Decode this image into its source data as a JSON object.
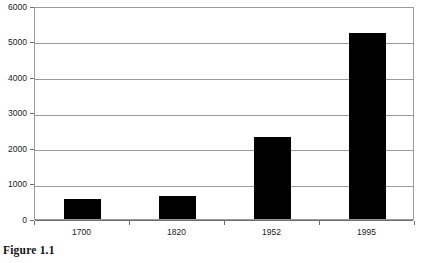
{
  "figure": {
    "caption": "Figure 1.1"
  },
  "chart_data": {
    "type": "bar",
    "title": "",
    "subtitle": "",
    "xlabel": "",
    "ylabel": "",
    "categories": [
      "1700",
      "1820",
      "1952",
      "1995"
    ],
    "values": [
      570,
      640,
      2300,
      5250
    ],
    "series": [
      {
        "name": "",
        "values": [
          570,
          640,
          2300,
          5250
        ]
      }
    ],
    "ylim": [
      0,
      6000
    ],
    "yticks": [
      0,
      1000,
      2000,
      3000,
      4000,
      5000,
      6000
    ],
    "ytick_labels": [
      "0",
      "1000",
      "2000",
      "3000",
      "4000",
      "5000",
      "6000"
    ],
    "xtick_labels": [
      "1700",
      "1820",
      "1952",
      "1995"
    ],
    "grid": true,
    "grid_axis": "y",
    "legend": false,
    "legend_position": "none",
    "annotations": [],
    "colors": {
      "bar_fill": "#000000",
      "gridline": "#9a9a9a",
      "axis_line": "#6e6e6e",
      "frame": "#9a9a9a",
      "background": "#ffffff",
      "text": "#1a1a1a"
    }
  }
}
